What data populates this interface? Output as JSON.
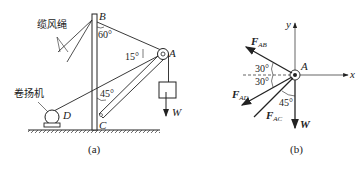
{
  "figure_a": {
    "caption": "(a)",
    "labels": {
      "B": "B",
      "A": "A",
      "C": "C",
      "D": "D",
      "W": "W"
    },
    "cn_labels": {
      "guy_rope": "缆风绳",
      "winch": "卷扬机"
    },
    "angles": {
      "at_B": "60°",
      "at_A": "15°",
      "at_C": "45°"
    }
  },
  "figure_b": {
    "caption": "(b)",
    "axes": {
      "x": "x",
      "y": "y"
    },
    "point": "A",
    "forces": {
      "FAB": {
        "F": "F",
        "sub": "AB"
      },
      "FAD": {
        "F": "F",
        "sub": "AD"
      },
      "FAC": {
        "F": "F",
        "sub": "AC"
      },
      "W": "W"
    },
    "angles": {
      "upper": "30°",
      "lower": "30°",
      "w_ac": "45°"
    }
  }
}
